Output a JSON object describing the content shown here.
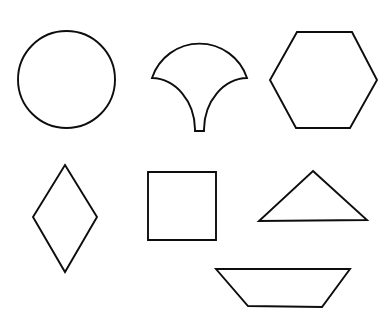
{
  "page": {
    "background_color": "#ffffff",
    "stroke_color": "#0d0d0d",
    "fill_color": "none",
    "width": 388,
    "height": 323,
    "shape_count": 7
  },
  "shapes": [
    {
      "id": "circle",
      "name": "circle",
      "row": 1,
      "column": 1,
      "label": "Circle",
      "geometry_type": "ellipse",
      "center": [
        66.5,
        79.5
      ],
      "radius_x": 48.5,
      "radius_y": 48.5,
      "bbox": [
        18,
        31,
        115,
        128
      ],
      "path": "M 115 79.5 A 48.5 48.5 0 1 1 18 79.5 A 48.5 48.5 0 1 1 115 79.5 Z"
    },
    {
      "id": "fan-leaf",
      "name": "fan-leaf",
      "row": 1,
      "column": 2,
      "label": "Fan / Ginkgo Leaf",
      "geometry_type": "compound-arc",
      "bbox": [
        152,
        29,
        247,
        132
      ],
      "apex_top": [
        199.5,
        29
      ],
      "left_corner": [
        152,
        78
      ],
      "right_corner": [
        247,
        78
      ],
      "stem_left": [
        195,
        131
      ],
      "stem_right": [
        204,
        131
      ],
      "path": "M 152 78 A 50 50 0 0 1 247 78 L 247 78 A 44 52 0 0 0 204 129 L 204 131 L 195 131 L 195 129 A 44 52 0 0 0 152 78 Z"
    },
    {
      "id": "hexagon",
      "name": "hexagon",
      "row": 1,
      "column": 3,
      "label": "Hexagon",
      "geometry_type": "polygon",
      "sides": 6,
      "bbox": [
        270,
        32,
        377,
        128
      ],
      "vertices": [
        [
          297,
          32
        ],
        [
          352,
          32
        ],
        [
          377,
          80
        ],
        [
          350,
          128
        ],
        [
          296,
          128
        ],
        [
          270,
          80
        ]
      ],
      "path": "M 297 32 L 352 32 L 377 80 L 350 128 L 296 128 L 270 80 Z"
    },
    {
      "id": "rhombus",
      "name": "rhombus",
      "row": 2,
      "column": 1,
      "label": "Rhombus / Diamond",
      "geometry_type": "polygon",
      "sides": 4,
      "bbox": [
        33,
        165,
        97,
        272
      ],
      "vertices": [
        [
          65,
          165
        ],
        [
          97,
          217
        ],
        [
          65,
          272
        ],
        [
          33,
          217
        ]
      ],
      "path": "M 65 165 L 97 217 L 65 272 L 33 217 Z"
    },
    {
      "id": "square",
      "name": "square",
      "row": 2,
      "column": 2,
      "label": "Square",
      "geometry_type": "polygon",
      "sides": 4,
      "bbox": [
        148,
        172,
        216,
        240
      ],
      "vertices": [
        [
          148,
          172
        ],
        [
          216,
          172
        ],
        [
          216,
          240
        ],
        [
          148,
          240
        ]
      ],
      "path": "M 148 172 L 216 172 L 216 240 L 148 240 Z"
    },
    {
      "id": "triangle",
      "name": "triangle",
      "row": 2,
      "column": 3,
      "label": "Triangle",
      "geometry_type": "polygon",
      "sides": 3,
      "bbox": [
        259,
        171,
        367,
        221
      ],
      "vertices": [
        [
          313,
          171
        ],
        [
          367,
          220
        ],
        [
          259,
          221
        ]
      ],
      "path": "M 313 171 L 367 220 L 259 221 Z"
    },
    {
      "id": "trapezoid",
      "name": "trapezoid",
      "row": 3,
      "column": 3,
      "label": "Trapezoid",
      "geometry_type": "polygon",
      "sides": 4,
      "bbox": [
        216,
        269,
        350,
        307
      ],
      "vertices": [
        [
          216,
          269
        ],
        [
          350,
          269
        ],
        [
          322,
          307
        ],
        [
          248,
          306
        ]
      ],
      "path": "M 216 269 L 350 269 L 322 307 L 248 306 Z"
    }
  ]
}
